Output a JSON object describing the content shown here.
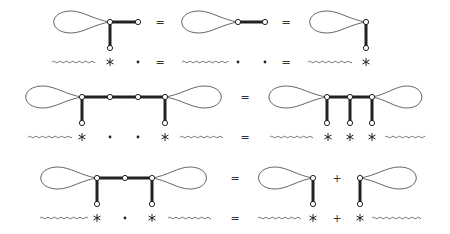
{
  "colors": {
    "ink": "#222222",
    "thin": "#555555",
    "background": "#ffffff"
  },
  "symbols": {
    "equals": "=",
    "plus": "+"
  },
  "rows": [
    {
      "id": "row-1",
      "top_y": 22,
      "stem_y": 48,
      "bottom_y": 62,
      "terms": [
        {
          "loop": [
            50,
            110
          ],
          "vertices": [
            110,
            138
          ],
          "open_vertices": [
            138
          ],
          "stems": [
            110
          ],
          "bold_h": [
            [
              110,
              138
            ]
          ],
          "loop_side": "left"
        },
        {
          "op": "equals",
          "x": 160
        },
        {
          "loop": [
            178,
            238
          ],
          "vertices": [
            238,
            265
          ],
          "open_vertices": [
            265
          ],
          "stems": [],
          "bold_h": [
            [
              238,
              265
            ]
          ],
          "loop_side": "left"
        },
        {
          "op": "equals",
          "x": 286
        },
        {
          "loop": [
            306,
            366
          ],
          "vertices": [
            366
          ],
          "open_vertices": [],
          "stems": [
            366
          ],
          "bold_h": [],
          "loop_side": "left"
        }
      ],
      "bottom": [
        {
          "type": "wavy",
          "x1": 52,
          "x2": 95
        },
        {
          "type": "star",
          "x": 110
        },
        {
          "type": "dot",
          "x": 138
        },
        {
          "type": "equals",
          "x": 160
        },
        {
          "type": "wavy",
          "x1": 182,
          "x2": 228
        },
        {
          "type": "dot",
          "x": 238
        },
        {
          "type": "dot",
          "x": 265
        },
        {
          "type": "equals",
          "x": 286
        },
        {
          "type": "wavy",
          "x1": 308,
          "x2": 352
        },
        {
          "type": "star",
          "x": 366
        }
      ]
    },
    {
      "id": "row-2",
      "top_y": 97,
      "stem_y": 123,
      "bottom_y": 137,
      "terms": [
        {
          "loop": [
            22,
            82
          ],
          "loop2": [
            165,
            225
          ],
          "vertices": [
            82,
            110,
            138,
            165
          ],
          "stems": [
            82,
            165
          ],
          "bold_h": [
            [
              82,
              165
            ]
          ]
        },
        {
          "op": "equals",
          "x": 245
        },
        {
          "loop": [
            265,
            327
          ],
          "loop2": [
            372,
            425
          ],
          "vertices": [
            327,
            350,
            372
          ],
          "stems": [
            327,
            350,
            372
          ],
          "bold_h": [
            [
              327,
              372
            ]
          ]
        }
      ],
      "bottom": [
        {
          "type": "wavy",
          "x1": 28,
          "x2": 72
        },
        {
          "type": "star",
          "x": 82
        },
        {
          "type": "dot",
          "x": 110
        },
        {
          "type": "dot",
          "x": 138
        },
        {
          "type": "star",
          "x": 165
        },
        {
          "type": "wavy",
          "x1": 180,
          "x2": 222
        },
        {
          "type": "equals",
          "x": 245
        },
        {
          "type": "wavy",
          "x1": 270,
          "x2": 312
        },
        {
          "type": "star",
          "x": 328
        },
        {
          "type": "star",
          "x": 350
        },
        {
          "type": "star",
          "x": 372
        },
        {
          "type": "wavy",
          "x1": 385,
          "x2": 425
        }
      ]
    },
    {
      "id": "row-3",
      "top_y": 178,
      "stem_y": 204,
      "bottom_y": 218,
      "terms": [
        {
          "loop": [
            37,
            97
          ],
          "loop2": [
            152,
            210
          ],
          "vertices": [
            97,
            125,
            152
          ],
          "stems": [
            97,
            152
          ],
          "bold_h": [
            [
              97,
              152
            ]
          ]
        },
        {
          "op": "equals",
          "x": 235
        },
        {
          "loop": [
            255,
            313
          ],
          "vertices": [
            313
          ],
          "stems": [
            313
          ],
          "bold_h": []
        },
        {
          "op": "plus",
          "x": 337
        },
        {
          "loop2": [
            360,
            420
          ],
          "vertices": [
            360
          ],
          "stems": [
            360
          ],
          "bold_h": []
        }
      ],
      "bottom": [
        {
          "type": "wavy",
          "x1": 40,
          "x2": 88
        },
        {
          "type": "star",
          "x": 97
        },
        {
          "type": "dot",
          "x": 125
        },
        {
          "type": "star",
          "x": 152
        },
        {
          "type": "wavy",
          "x1": 168,
          "x2": 210
        },
        {
          "type": "equals",
          "x": 235
        },
        {
          "type": "wavy",
          "x1": 258,
          "x2": 300
        },
        {
          "type": "star",
          "x": 313
        },
        {
          "type": "plus",
          "x": 337
        },
        {
          "type": "star",
          "x": 360
        },
        {
          "type": "wavy",
          "x1": 372,
          "x2": 420
        }
      ]
    }
  ]
}
